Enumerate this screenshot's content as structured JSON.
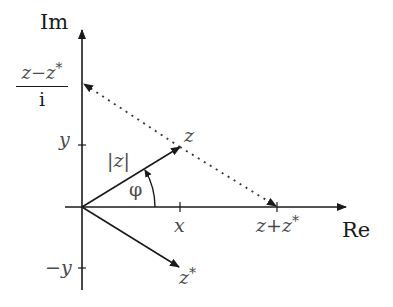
{
  "diagram": {
    "colors": {
      "axis": "#1a1a1a",
      "vector": "#1a1a1a",
      "dotted": "#333333",
      "label": "#4a4a4a",
      "background": "#ffffff"
    },
    "axes": {
      "imaginary_label": "Im",
      "real_label": "Re"
    },
    "ticks": {
      "y": "y",
      "neg_y": "−y",
      "x": "x"
    },
    "points": {
      "z": "z",
      "z_conj": "z",
      "z_conj_star": "*",
      "sum_left": "z",
      "sum_op": "+",
      "sum_right": "z",
      "sum_star": "*",
      "diff_numerator_left": "z",
      "diff_op": "−",
      "diff_numerator_right": "z",
      "diff_star": "*",
      "diff_denominator": "i"
    },
    "annotations": {
      "modulus": "|z|",
      "angle": "φ"
    }
  }
}
